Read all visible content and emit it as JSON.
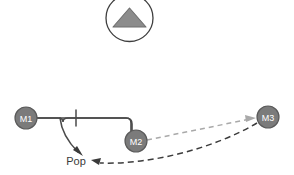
{
  "diagram": {
    "title": "",
    "colors": {
      "node_fill": "#7b7b7b",
      "node_stroke": "#5a5a5a",
      "node_text": "#ffffff",
      "solid_edge": "#4a4a4a",
      "dashed_dark_edge": "#3c3c3c",
      "dashed_light_edge": "#a9a9a9",
      "button_circle_stroke": "#3f3f3f",
      "triangle_fill": "#8c8c8c",
      "triangle_stroke": "#6e6e6e",
      "background": "#ffffff",
      "label_text": "#3a3a3a"
    },
    "up_button": {
      "name": "up-arrow-button",
      "icon": "triangle-up-icon",
      "label": "",
      "cx": 129.5,
      "cy": 18,
      "r": 23.5
    },
    "nodes": [
      {
        "id": "m1",
        "label": "M1",
        "cx": 26,
        "cy": 118,
        "r": 11
      },
      {
        "id": "m2",
        "label": "M2",
        "cx": 136,
        "cy": 141,
        "r": 11
      },
      {
        "id": "m3",
        "label": "M3",
        "cx": 268,
        "cy": 117,
        "r": 11
      }
    ],
    "labels": [
      {
        "id": "pop",
        "text": "Pop",
        "x": 76,
        "y": 161
      }
    ],
    "edges": [
      {
        "id": "m1-to-m2",
        "style": "solid",
        "from": "m1",
        "to": "m2",
        "has_tick": true,
        "tick_x": 76,
        "arrow": false
      },
      {
        "id": "branch-to-pop",
        "style": "solid",
        "from": "m1-to-m2",
        "to": "pop",
        "arrow": true
      },
      {
        "id": "m2-to-m3",
        "style": "dashed",
        "weight": "light",
        "from": "m2",
        "to": "m3",
        "arrow": true
      },
      {
        "id": "m3-to-pop",
        "style": "dashed",
        "weight": "dark",
        "from": "m3",
        "to": "pop",
        "arrow": true
      }
    ]
  }
}
